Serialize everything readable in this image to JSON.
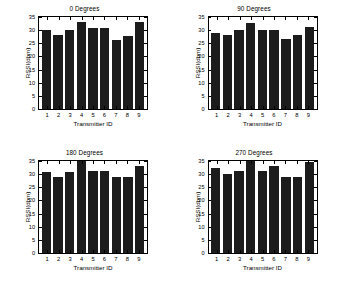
{
  "figure": {
    "background": "#ffffff",
    "bar_color": "#1c1c1c",
    "axis_color": "#000000"
  },
  "chart_data": [
    {
      "type": "bar",
      "title": "0 Degrees",
      "xlabel": "Transmitter ID",
      "ylabel": "RSSI(dbm)",
      "categories": [
        "1",
        "2",
        "3",
        "4",
        "5",
        "6",
        "7",
        "8",
        "9"
      ],
      "values": [
        30.0,
        28.0,
        30.1,
        33.1,
        31.0,
        31.0,
        26.1,
        27.6,
        33.1
      ],
      "ylim": [
        0,
        35
      ],
      "yticks": [
        0,
        5,
        10,
        15,
        20,
        25,
        30,
        35
      ],
      "grid": false,
      "legend": null
    },
    {
      "type": "bar",
      "title": "90 Degrees",
      "xlabel": "Transmitter ID",
      "ylabel": "RSSI(dbm)",
      "categories": [
        "1",
        "2",
        "3",
        "4",
        "5",
        "6",
        "7",
        "8",
        "9"
      ],
      "values": [
        29.0,
        28.0,
        30.0,
        32.6,
        30.0,
        30.0,
        26.6,
        28.0,
        31.1
      ],
      "ylim": [
        0,
        35
      ],
      "yticks": [
        0,
        5,
        10,
        15,
        20,
        25,
        30,
        35
      ],
      "grid": false,
      "legend": null
    },
    {
      "type": "bar",
      "title": "180 Degrees",
      "xlabel": "Transmitter ID",
      "ylabel": "RSSI(dbm)",
      "categories": [
        "1",
        "2",
        "3",
        "4",
        "5",
        "6",
        "7",
        "8",
        "9"
      ],
      "values": [
        31.0,
        29.1,
        31.0,
        35.0,
        31.1,
        31.1,
        29.1,
        29.1,
        33.1
      ],
      "ylim": [
        0,
        35
      ],
      "yticks": [
        0,
        5,
        10,
        15,
        20,
        25,
        30,
        35
      ],
      "grid": false,
      "legend": null
    },
    {
      "type": "bar",
      "title": "270 Degrees",
      "xlabel": "Transmitter ID",
      "ylabel": "RSSI(dbm)",
      "categories": [
        "1",
        "2",
        "3",
        "4",
        "5",
        "6",
        "7",
        "8",
        "9"
      ],
      "values": [
        32.2,
        30.1,
        31.1,
        35.0,
        31.2,
        33.1,
        29.1,
        29.1,
        34.6
      ],
      "ylim": [
        0,
        35
      ],
      "yticks": [
        0,
        5,
        10,
        15,
        20,
        25,
        30,
        35
      ],
      "grid": false,
      "legend": null
    }
  ]
}
